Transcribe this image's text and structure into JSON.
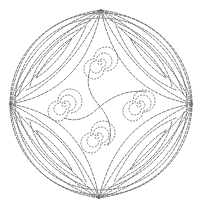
{
  "figure": {
    "stroke_color": "#6a6a6a",
    "background": "#ffffff",
    "circle": {
      "cx": 101,
      "cy": 104,
      "r": 91
    },
    "apexes": {
      "top": [
        101,
        10
      ],
      "right": [
        192,
        104
      ],
      "bottom": [
        99,
        198
      ],
      "left": [
        10,
        104
      ]
    },
    "spirals": [
      {
        "name": "top",
        "cx": 100,
        "cy": 63
      },
      {
        "name": "right",
        "cx": 139,
        "cy": 105
      },
      {
        "name": "bottom",
        "cx": 97,
        "cy": 137
      },
      {
        "name": "left",
        "cx": 64,
        "cy": 105
      }
    ]
  }
}
